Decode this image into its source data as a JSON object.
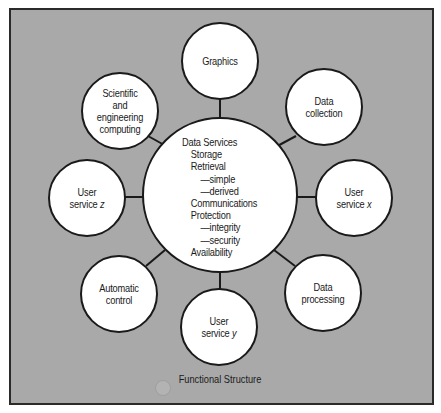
{
  "diagram": {
    "title": "Functional Structure",
    "colors": {
      "background": "#a9a9a9",
      "node_fill": "#ffffff",
      "stroke": "#1a1a1a"
    },
    "center": {
      "id": "data-services",
      "heading": "Data Services",
      "items": [
        {
          "label": "Storage",
          "level": 1
        },
        {
          "label": "Retrieval",
          "level": 1
        },
        {
          "label": "—simple",
          "level": 2
        },
        {
          "label": "—derived",
          "level": 2
        },
        {
          "label": "Communications",
          "level": 1
        },
        {
          "label": "Protection",
          "level": 1
        },
        {
          "label": "—integrity",
          "level": 2
        },
        {
          "label": "—security",
          "level": 2
        },
        {
          "label": "Availability",
          "level": 1
        }
      ]
    },
    "nodes": [
      {
        "id": "graphics",
        "lines": [
          "Graphics"
        ]
      },
      {
        "id": "data-collection",
        "lines": [
          "Data",
          "collection"
        ]
      },
      {
        "id": "user-service-x",
        "lines": [
          "User",
          "service x"
        ],
        "italic_suffix": "x"
      },
      {
        "id": "data-processing",
        "lines": [
          "Data",
          "processing"
        ]
      },
      {
        "id": "user-service-y",
        "lines": [
          "User",
          "service y"
        ],
        "italic_suffix": "y"
      },
      {
        "id": "automatic-control",
        "lines": [
          "Automatic",
          "control"
        ]
      },
      {
        "id": "user-service-z",
        "lines": [
          "User",
          "service z"
        ],
        "italic_suffix": "z"
      },
      {
        "id": "scientific-engineering-computing",
        "lines": [
          "Scientific",
          "and",
          "engineering",
          "computing"
        ]
      }
    ],
    "edges": [
      [
        "data-services",
        "graphics"
      ],
      [
        "data-services",
        "data-collection"
      ],
      [
        "data-services",
        "user-service-x"
      ],
      [
        "data-services",
        "data-processing"
      ],
      [
        "data-services",
        "user-service-y"
      ],
      [
        "data-services",
        "automatic-control"
      ],
      [
        "data-services",
        "user-service-z"
      ],
      [
        "data-services",
        "scientific-engineering-computing"
      ]
    ]
  },
  "labels": {
    "graphics": {
      "l1": "Graphics"
    },
    "data_collection": {
      "l1": "Data",
      "l2": "collection"
    },
    "user_service_x": {
      "l1": "User",
      "l2": "service",
      "var": "x"
    },
    "data_processing": {
      "l1": "Data",
      "l2": "processing"
    },
    "user_service_y": {
      "l1": "User",
      "l2": "service",
      "var": "y"
    },
    "automatic_control": {
      "l1": "Automatic",
      "l2": "control"
    },
    "user_service_z": {
      "l1": "User",
      "l2": "service",
      "var": "z"
    },
    "scientific": {
      "l1": "Scientific",
      "l2": "and",
      "l3": "engineering",
      "l4": "computing"
    },
    "center": {
      "heading": "Data Services",
      "i0": "Storage",
      "i1": "Retrieval",
      "i2": "—simple",
      "i3": "—derived",
      "i4": "Communications",
      "i5": "Protection",
      "i6": "—integrity",
      "i7": "—security",
      "i8": "Availability"
    },
    "caption": "Functional Structure"
  }
}
